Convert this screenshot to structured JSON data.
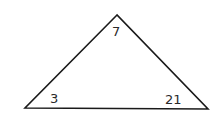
{
  "diagram": {
    "shape": "triangle",
    "stroke_color": "#1a1a1a",
    "vertices": {
      "top": {
        "x": 117,
        "y": 15,
        "label": "7"
      },
      "bottom_left": {
        "x": 25,
        "y": 108,
        "label": "3"
      },
      "bottom_right": {
        "x": 208,
        "y": 109,
        "label": "21"
      }
    }
  }
}
